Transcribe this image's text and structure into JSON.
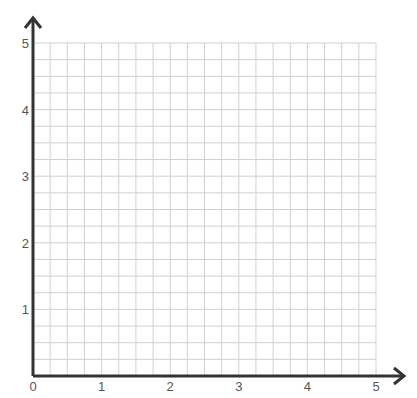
{
  "chart_data": {
    "type": "scatter",
    "title": "",
    "xlabel": "",
    "ylabel": "",
    "xlim": [
      0,
      5
    ],
    "ylim": [
      0,
      5
    ],
    "x_ticks": [
      "0",
      "1",
      "2",
      "3",
      "4",
      "5"
    ],
    "y_ticks": [
      "1",
      "2",
      "3",
      "4",
      "5"
    ],
    "grid": true,
    "minor_divisions_per_unit": 4,
    "series": [],
    "legend": null
  },
  "colors": {
    "axis": "#333333",
    "grid": "#d0d0d0",
    "tick_label": "#555555"
  },
  "layout": {
    "origin_px": [
      33,
      376
    ],
    "unit_px_x": 68.6,
    "unit_px_y": 66.6
  }
}
